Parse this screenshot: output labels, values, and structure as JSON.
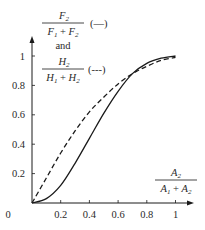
{
  "chart_data": {
    "type": "line",
    "title": "",
    "xlabel": "A2 / (A1 + A2)",
    "ylabel": "F2 / (F1 + F2) (—) and H2 / (H1 + H2) (---)",
    "xlim": [
      0,
      1
    ],
    "ylim": [
      0,
      1
    ],
    "grid": false,
    "legend_position": "inline top-left, next to y-axis label",
    "x_ticks": [
      "0",
      "0.2",
      "0.4",
      "0.6",
      "0.8",
      "1"
    ],
    "y_ticks": [
      "0.2",
      "0.4",
      "0.6",
      "0.8",
      "1"
    ],
    "x": [
      0,
      0.1,
      0.2,
      0.3,
      0.4,
      0.5,
      0.6,
      0.7,
      0.8,
      0.9,
      1.0
    ],
    "series": [
      {
        "name": "F2/(F1+F2)",
        "style": "solid",
        "values": [
          0,
          0.03,
          0.12,
          0.27,
          0.44,
          0.61,
          0.76,
          0.88,
          0.95,
          0.985,
          1.0
        ]
      },
      {
        "name": "H2/(H1+H2)",
        "style": "dashed",
        "values": [
          0,
          0.17,
          0.34,
          0.49,
          0.62,
          0.72,
          0.81,
          0.88,
          0.93,
          0.97,
          0.99
        ]
      }
    ]
  },
  "labels": {
    "y_num_1": "F",
    "y_num_1_sub": "2",
    "y_den_1a": "F",
    "y_den_1a_sub": "1",
    "y_den_plus": " + ",
    "y_den_1b": "F",
    "y_den_1b_sub": "2",
    "y_legend_1": "(—)",
    "and": "and",
    "y_num_2": "H",
    "y_num_2_sub": "2",
    "y_den_2a": "H",
    "y_den_2a_sub": "1",
    "y_den_2b": "H",
    "y_den_2b_sub": "2",
    "y_legend_2": "(---)",
    "x_num": "A",
    "x_num_sub": "2",
    "x_den_a": "A",
    "x_den_a_sub": "1",
    "x_den_b": "A",
    "x_den_b_sub": "2"
  },
  "colors": {
    "ink": "#1a1a1a",
    "background": "#ffffff"
  }
}
